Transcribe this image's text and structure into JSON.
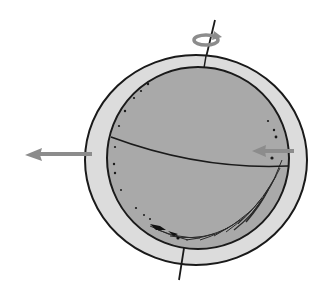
{
  "diagram": {
    "elements": {
      "outer_shell": {
        "name": "outer-shell",
        "fill": "#dcdcdc",
        "stroke": "#1a1a1a"
      },
      "inner_sphere": {
        "name": "inner-sphere",
        "fill": "#a9a9a9",
        "stroke": "#1a1a1a"
      },
      "equator": {
        "name": "equator-line",
        "stroke": "#1a1a1a"
      },
      "rotation_axis": {
        "name": "rotation-axis",
        "stroke": "#1a1a1a"
      },
      "rotation_arrow": {
        "name": "rotation-arrow-icon",
        "color": "#8c8c8c"
      },
      "left_arrow": {
        "name": "left-arrow-icon",
        "color": "#8c8c8c",
        "direction": "left"
      },
      "right_arrow": {
        "name": "inner-left-arrow-icon",
        "color": "#8c8c8c",
        "direction": "left"
      }
    }
  }
}
